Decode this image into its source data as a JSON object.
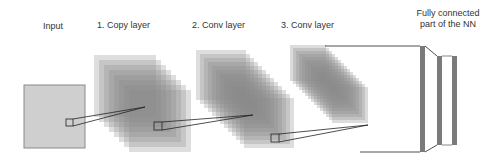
{
  "diagram": {
    "labels": {
      "input": "Input",
      "copy_layer": "1. Copy layer",
      "conv_layer_2": "2. Conv layer",
      "conv_layer_3": "3. Conv layer",
      "fully_connected_line1": "Fully connected",
      "fully_connected_line2": "part of the NN"
    },
    "colors": {
      "input_fill": "#cfcfcf",
      "stack_fill": "#8a8a8a",
      "outline": "#222222",
      "fc_bar": "#7a7a7a"
    }
  }
}
